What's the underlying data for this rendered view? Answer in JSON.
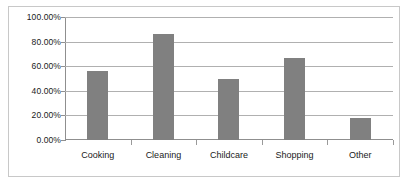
{
  "chart_data": {
    "type": "bar",
    "title": "",
    "subtitle": "",
    "xlabel": "",
    "ylabel": "",
    "categories": [
      "Cooking",
      "Cleaning",
      "Childcare",
      "Shopping",
      "Other"
    ],
    "values": [
      56.0,
      86.0,
      50.0,
      67.0,
      18.0
    ],
    "value_labels": [
      "56.00%",
      "86.00%",
      "50.00%",
      "67.00%",
      "18.00%"
    ],
    "ylim": [
      0,
      100
    ],
    "ytick_values": [
      0,
      20,
      40,
      60,
      80,
      100
    ],
    "ytick_labels": [
      "0.00%",
      "20.00%",
      "40.00%",
      "60.00%",
      "80.00%",
      "100.00%"
    ],
    "grid": true,
    "legend": false,
    "legend_position": "none",
    "series": [
      {
        "name": "",
        "values": [
          56.0,
          86.0,
          50.0,
          67.0,
          18.0
        ],
        "color": "#808080"
      }
    ]
  },
  "style": {
    "bar_color": "#808080",
    "gridline_color": "#b0b0b0",
    "axis_color": "#8f8f8f",
    "frame_color": "#c8c8c8",
    "background": "#ffffff",
    "text_color": "#1a1a1a"
  }
}
